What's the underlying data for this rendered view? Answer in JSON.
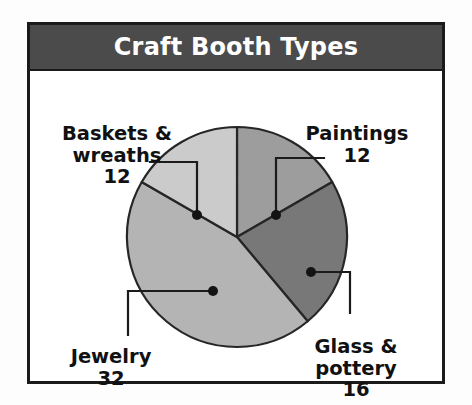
{
  "chart_data": {
    "type": "pie",
    "title": "Craft Booth Types",
    "categories": [
      "Paintings",
      "Glass & pottery",
      "Jewelry",
      "Baskets & wreaths"
    ],
    "values": [
      12,
      16,
      32,
      12
    ],
    "total": 72,
    "slice_colors": [
      "#9d9d9d",
      "#787878",
      "#b4b4b4",
      "#cbcbcb"
    ],
    "slice_order_clockwise_from_top": [
      "Paintings",
      "Glass & pottery",
      "Jewelry",
      "Baskets & wreaths"
    ],
    "slice_angles_deg": [
      60,
      80,
      160,
      60
    ],
    "legend": "none",
    "data_labels": true,
    "grid": false,
    "xlabel": "",
    "ylabel": ""
  },
  "panel": {
    "title": "Craft Booth Types",
    "title_bar_color": "#4b4b4b",
    "title_text_color": "#ffffff",
    "border_color": "#1b1b1b",
    "background": "#ffffff"
  },
  "labels": {
    "baskets": {
      "name": "Baskets &\nwreaths",
      "value": "12"
    },
    "paintings": {
      "name": "Paintings",
      "value": "12"
    },
    "glass": {
      "name": "Glass &\npottery",
      "value": "16"
    },
    "jewelry": {
      "name": "Jewelry",
      "value": "32"
    }
  }
}
